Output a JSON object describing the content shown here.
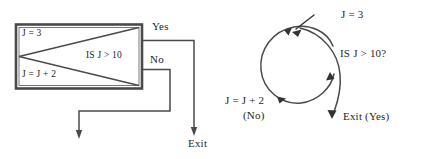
{
  "figure": {
    "background_color": "#ffffff",
    "stroke_color": "#3a3a3a",
    "text_color": "#262626",
    "width": 423,
    "height": 159
  },
  "left_diagram": {
    "name": "flowchart-loop-box",
    "box": {
      "init_statement": "J = 3",
      "condition": "IS J > 10",
      "increment_statement": "J = J + 2"
    },
    "branches": {
      "yes_label": "Yes",
      "no_label": "No"
    },
    "exit_label": "Exit"
  },
  "right_diagram": {
    "name": "spiral-loop",
    "init_statement": "J = 3",
    "condition": "IS J > 10?",
    "increment_statement": "J = J + 2",
    "no_label": "(No)",
    "exit_label": "Exit (Yes)"
  }
}
